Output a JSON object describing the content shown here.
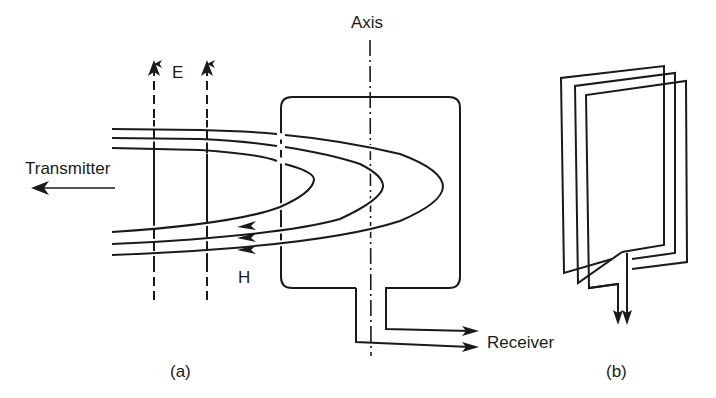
{
  "figure": {
    "panel_a": {
      "caption": "(a)",
      "labels": {
        "axis": "Axis",
        "electric_field": "E",
        "magnetic_field": "H",
        "transmitter": "Transmitter",
        "receiver": "Receiver"
      }
    },
    "panel_b": {
      "caption": "(b)"
    },
    "colors": {
      "stroke": "#1a1a1a",
      "background": "#ffffff"
    }
  }
}
